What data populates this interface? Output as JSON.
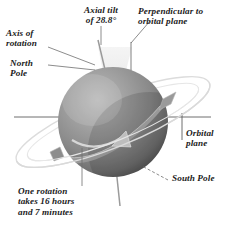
{
  "figure": {
    "name": "planet-axial-tilt-diagram",
    "background_color": "#ffffff",
    "text_color": "#1b1b1b",
    "sphere_color": "#8c8c8c",
    "ring_color": "#e2e2e2",
    "wedge_color": "#ededed",
    "line_color": "#6f6f6f"
  },
  "labels": {
    "axial_tilt": "Axial tilt\nof 28.8°",
    "perpendicular": "Perpendicular to\norbital plane",
    "axis_of_rotation": "Axis of\nrotation",
    "north_pole": "North\nPole",
    "orbital_plane": "Orbital\nplane",
    "south_pole": "South Pole",
    "rotation_period": "One rotation\ntakes 16 hours\nand 7 minutes"
  },
  "values": {
    "axial_tilt_degrees": "28.8°",
    "rotation_hours": "16",
    "rotation_minutes": "7"
  }
}
